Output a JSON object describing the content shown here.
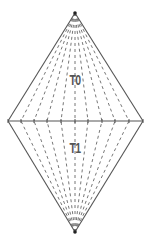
{
  "diagram": {
    "type": "double-pyramid-fan-subdivision",
    "colors": {
      "edge": "#555555",
      "dash": "#777777",
      "label": "#555555",
      "vertex": "#222222",
      "background": "#ffffff"
    },
    "vertices": {
      "top": {
        "x": 75,
        "y": 13
      },
      "bottom": {
        "x": 75,
        "y": 232
      },
      "left": {
        "x": 8,
        "y": 121
      },
      "right": {
        "x": 143,
        "y": 121
      }
    },
    "base_points_x": [
      8,
      21,
      34,
      47,
      61,
      75,
      88,
      102,
      115,
      129,
      143
    ],
    "labels": [
      {
        "id": "T0",
        "text": "T0",
        "x": 75,
        "y": 80
      },
      {
        "id": "T1",
        "text": "T1",
        "x": 75,
        "y": 148
      }
    ]
  }
}
